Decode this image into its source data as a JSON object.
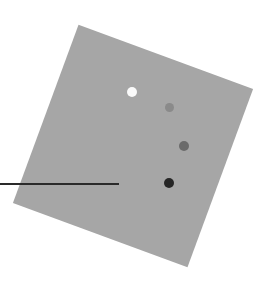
{
  "scene": {
    "background": "#ffffff",
    "panel": {
      "color": "#a6a6a6",
      "rotation_deg": 20.2
    },
    "line": {
      "color": "#2a2a2a",
      "x1": 0,
      "y1": 184,
      "x2": 119,
      "y2": 184
    },
    "dots": [
      {
        "label": "dot-white",
        "cx": 132,
        "cy": 92,
        "r": 5,
        "color": "#fafafa"
      },
      {
        "label": "dot-light-gray",
        "cx": 169,
        "cy": 107,
        "r": 4.5,
        "color": "#8a8a8a"
      },
      {
        "label": "dot-mid-gray",
        "cx": 184,
        "cy": 146,
        "r": 5,
        "color": "#6a6a6a"
      },
      {
        "label": "dot-dark",
        "cx": 169,
        "cy": 183,
        "r": 5,
        "color": "#262626"
      }
    ]
  }
}
